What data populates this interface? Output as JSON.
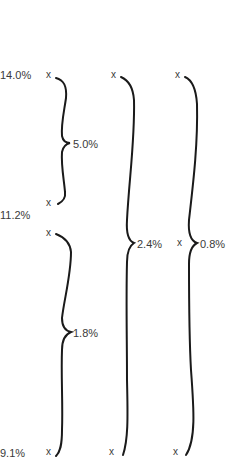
{
  "axis_labels": {
    "top": "14.0%",
    "middle": "11.2%",
    "bottom": "9.1%"
  },
  "point_marker": "x",
  "braces": [
    {
      "id": "col1-upper",
      "label": "5.0%",
      "from": "14.0%",
      "to": "11.2%"
    },
    {
      "id": "col1-lower",
      "label": "1.8%",
      "from": "11.2%",
      "to": "9.1%"
    },
    {
      "id": "col2",
      "label": "2.4%",
      "from": "14.0%",
      "to": "9.1%"
    },
    {
      "id": "col3",
      "label": "0.8%",
      "from": "14.0%",
      "to": "9.1%"
    }
  ]
}
